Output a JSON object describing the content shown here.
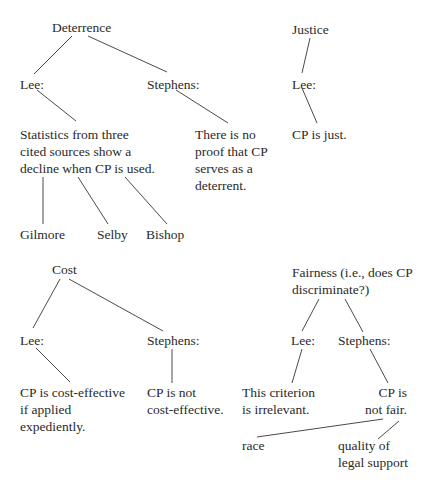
{
  "trees": [
    {
      "topic": "Deterrence",
      "lee_label": "Lee:",
      "stephens_label": "Stephens:",
      "lee_claim": [
        "Statistics from three",
        "cited sources show a",
        "decline when CP is used."
      ],
      "stephens_claim": [
        "There is no",
        "proof that CP",
        "serves as a",
        "deterrent."
      ],
      "sources": [
        "Gilmore",
        "Selby",
        "Bishop"
      ]
    },
    {
      "topic": "Justice",
      "lee_label": "Lee:",
      "lee_claim": [
        "CP is just."
      ]
    },
    {
      "topic": "Cost",
      "lee_label": "Lee:",
      "stephens_label": "Stephens:",
      "lee_claim": [
        "CP is cost-effective",
        "if applied",
        "expediently."
      ],
      "stephens_claim": [
        "CP is not",
        "cost-effective."
      ]
    },
    {
      "topic": [
        "Fairness (i.e., does CP",
        "discriminate?)"
      ],
      "lee_label": "Lee:",
      "stephens_label": "Stephens:",
      "lee_claim": [
        "This criterion",
        "is irrelevant."
      ],
      "stephens_claim": [
        "CP is",
        "not fair."
      ],
      "factors": [
        "race",
        [
          "quality of",
          "legal support"
        ]
      ]
    }
  ]
}
